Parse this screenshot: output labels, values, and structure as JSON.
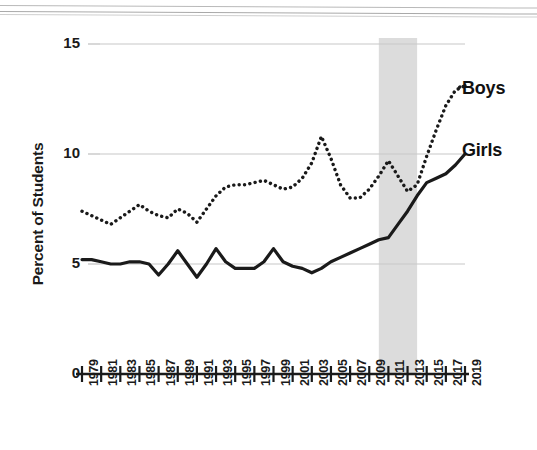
{
  "figure": {
    "background_color": "#ffffff",
    "ink_color": "#1a1a1a",
    "gridline_color": "#c8c8c8",
    "shaded_band_color": "#dcdcdc"
  },
  "axes": {
    "y_axis_title": "Percent of Students",
    "y_tick_labels": [
      "15",
      "10",
      "5",
      "0"
    ],
    "y_tick_values": [
      15,
      10,
      5,
      0
    ],
    "x_tick_labels": [
      "1979",
      "1981",
      "1983",
      "1985",
      "1987",
      "1989",
      "1991",
      "1993",
      "1995",
      "1997",
      "1999",
      "2001",
      "2003",
      "2005",
      "2007",
      "2009",
      "2011",
      "2013",
      "2015",
      "2017",
      "2019"
    ]
  },
  "series_labels": {
    "boys": "Boys",
    "girls": "Girls"
  },
  "chart_data": {
    "type": "line",
    "title": "",
    "subtitle": "",
    "xlabel": "",
    "ylabel": "Percent of Students",
    "xlim": [
      1979,
      2019
    ],
    "ylim": [
      0,
      15
    ],
    "grid": true,
    "gridlines_y": [
      5,
      10,
      15
    ],
    "legend_position": "inline-right",
    "annotations": [
      {
        "type": "shaded-band",
        "axis": "x",
        "from": 2010,
        "to": 2014,
        "color": "#dcdcdc",
        "label": ""
      }
    ],
    "x": [
      1979,
      1980,
      1981,
      1982,
      1983,
      1984,
      1985,
      1986,
      1987,
      1988,
      1989,
      1990,
      1991,
      1992,
      1993,
      1994,
      1995,
      1996,
      1997,
      1998,
      1999,
      2000,
      2001,
      2002,
      2003,
      2004,
      2005,
      2006,
      2007,
      2008,
      2009,
      2010,
      2011,
      2012,
      2013,
      2014,
      2015,
      2016,
      2017,
      2018,
      2019
    ],
    "series": [
      {
        "name": "Boys",
        "style": "dotted",
        "color": "#1a1a1a",
        "values": [
          7.4,
          7.2,
          7.0,
          6.8,
          7.1,
          7.4,
          7.7,
          7.4,
          7.2,
          7.1,
          7.5,
          7.3,
          6.9,
          7.5,
          8.1,
          8.5,
          8.6,
          8.6,
          8.7,
          8.8,
          8.6,
          8.4,
          8.5,
          8.9,
          9.6,
          10.8,
          9.8,
          8.6,
          8.0,
          8.0,
          8.4,
          9.0,
          9.7,
          9.0,
          8.3,
          8.6,
          9.9,
          11.1,
          12.2,
          12.9,
          13.1
        ]
      },
      {
        "name": "Girls",
        "style": "solid",
        "color": "#1a1a1a",
        "values": [
          5.2,
          5.2,
          5.1,
          5.0,
          5.0,
          5.1,
          5.1,
          5.0,
          4.5,
          5.0,
          5.6,
          5.0,
          4.4,
          5.0,
          5.7,
          5.1,
          4.8,
          4.8,
          4.8,
          5.1,
          5.7,
          5.1,
          4.9,
          4.8,
          4.6,
          4.8,
          5.1,
          5.3,
          5.5,
          5.7,
          5.9,
          6.1,
          6.2,
          6.8,
          7.4,
          8.1,
          8.7,
          8.9,
          9.1,
          9.5,
          10.0
        ]
      }
    ]
  }
}
